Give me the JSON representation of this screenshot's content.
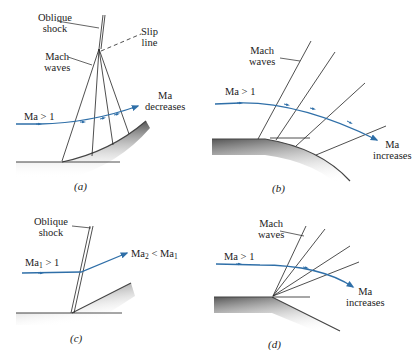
{
  "panels": {
    "a": {
      "caption": "(a)",
      "labels": {
        "oblique_shock": "Oblique\nshock",
        "slip_line": "Slip\nline",
        "mach_waves": "Mach\nwaves",
        "inflow": "Ma > 1",
        "outflow_line1": "Ma",
        "outflow_line2": "decreases"
      }
    },
    "b": {
      "caption": "(b)",
      "labels": {
        "mach_waves": "Mach\nwaves",
        "inflow": "Ma > 1",
        "outflow_line1": "Ma",
        "outflow_line2": "increases"
      }
    },
    "c": {
      "caption": "(c)",
      "labels": {
        "oblique_shock": "Oblique\nshock",
        "inflow_ma": "Ma",
        "inflow_sub": "1",
        "inflow_rest": " > 1",
        "outflow_ma2": "Ma",
        "outflow_sub2": "2",
        "outflow_mid": " < Ma",
        "outflow_sub1": "1"
      }
    },
    "d": {
      "caption": "(d)",
      "labels": {
        "mach_waves": "Mach\nwaves",
        "inflow": "Ma > 1",
        "outflow_line1": "Ma",
        "outflow_line2": "increases"
      }
    }
  },
  "colors": {
    "streamline": "#2f6fa8",
    "lines": "#222222",
    "wall_dark": "#555555",
    "wall_light": "#ffffff"
  }
}
